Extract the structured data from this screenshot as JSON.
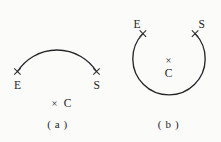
{
  "page": {
    "background_color": "#fbfbfa",
    "ink_color": "#26262a"
  },
  "figures": [
    {
      "id": "a",
      "caption": "( a )",
      "arc_type": "minor-arc",
      "endpoint_start_label": "E",
      "endpoint_end_label": "S",
      "center_marker_glyph": "×",
      "center_label": "C",
      "center_layout": "horizontal"
    },
    {
      "id": "b",
      "caption": "( b )",
      "arc_type": "major-arc",
      "endpoint_start_label": "E",
      "endpoint_end_label": "S",
      "center_marker_glyph": "×",
      "center_label": "C",
      "center_layout": "vertical"
    }
  ],
  "markers": {
    "endpoint_glyph": "×"
  }
}
